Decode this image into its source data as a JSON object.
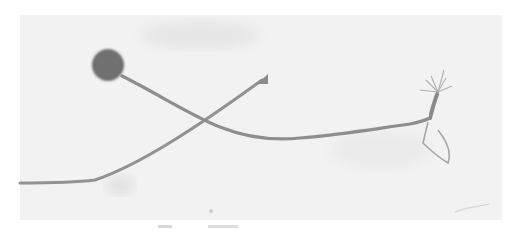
{
  "image": {
    "description": "Grayscale photograph of two thin filament-like structures on a pale background: one with a dark round head at upper-left, the other with a small triangular tip, crossing each other; the right end shows a branched, root-like tuft.",
    "colors": {
      "background": "#f1f1f1",
      "paper": "#ffffff",
      "filament": "#8c8c8c",
      "head": "#6f6f6f",
      "tuft": "#9a9a9a"
    }
  }
}
